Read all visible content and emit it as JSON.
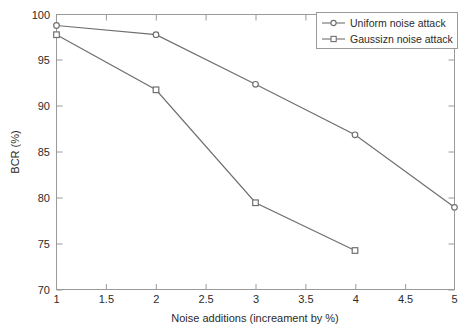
{
  "chart_data": {
    "type": "line",
    "title": "",
    "xlabel": "Noise additions (increament by %)",
    "ylabel": "BCR (%)",
    "xlim": [
      1,
      5
    ],
    "ylim": [
      70,
      100
    ],
    "grid": false,
    "legend_position": "top-right",
    "xticks": [
      "1",
      "1.5",
      "2",
      "2.5",
      "3",
      "3.5",
      "4",
      "4.5",
      "5"
    ],
    "xtick_values": [
      1,
      1.5,
      2,
      2.5,
      3,
      3.5,
      4,
      4.5,
      5
    ],
    "yticks": [
      "70",
      "75",
      "80",
      "85",
      "90",
      "95",
      "100"
    ],
    "ytick_values": [
      70,
      75,
      80,
      85,
      90,
      95,
      100
    ],
    "series": [
      {
        "name": "Uniform noise attack",
        "marker": "circle",
        "color": "#6f6f6f",
        "x": [
          1,
          2,
          3,
          4,
          5
        ],
        "values": [
          98.8,
          97.8,
          92.4,
          86.9,
          79.0
        ]
      },
      {
        "name": "Gaussizn noise attack",
        "marker": "square",
        "color": "#6f6f6f",
        "x": [
          1,
          2,
          3,
          4
        ],
        "values": [
          97.8,
          91.8,
          79.5,
          74.3
        ]
      }
    ]
  },
  "legend": {
    "entries": [
      {
        "label": "Uniform noise attack",
        "marker": "circle"
      },
      {
        "label": "Gaussizn noise attack",
        "marker": "square"
      }
    ]
  },
  "colors": {
    "line": "#6f6f6f",
    "axis": "#9a9a9a",
    "text": "#2b2b2b",
    "background": "#ffffff"
  }
}
